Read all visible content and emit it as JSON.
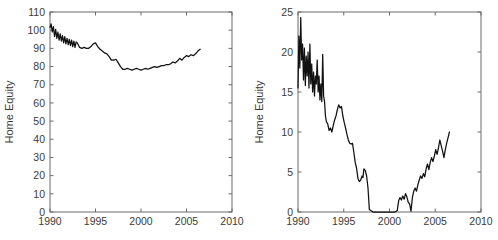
{
  "figure": {
    "background_color": "#ffffff",
    "axis_color": "#6b6b6b",
    "line_color": "#111111",
    "panel_count": 2
  },
  "chart_data": [
    {
      "type": "line",
      "panel": "left",
      "title": "",
      "xlabel": "",
      "ylabel": "Home Equity",
      "xlim": [
        1990,
        2010
      ],
      "ylim": [
        0,
        110
      ],
      "xticks": [
        1990,
        1995,
        2000,
        2005,
        2010
      ],
      "xticklabels": [
        "1990",
        "1995",
        "2000",
        "2005",
        "2010"
      ],
      "yticks": [
        0,
        10,
        20,
        30,
        40,
        50,
        60,
        70,
        80,
        90,
        100,
        110
      ],
      "yticklabels": [
        "0",
        "10",
        "20",
        "30",
        "40",
        "50",
        "60",
        "70",
        "80",
        "90",
        "100",
        "110"
      ],
      "grid": false,
      "legend": false,
      "series": [
        {
          "name": "Home Equity",
          "x": [
            1990.0,
            1990.12,
            1990.25,
            1990.37,
            1990.5,
            1990.62,
            1990.75,
            1990.87,
            1991.0,
            1991.12,
            1991.25,
            1991.37,
            1991.5,
            1991.62,
            1991.75,
            1991.87,
            1992.0,
            1992.12,
            1992.25,
            1992.37,
            1992.5,
            1992.62,
            1992.75,
            1992.87,
            1993.0,
            1993.25,
            1993.5,
            1993.75,
            1994.0,
            1994.25,
            1994.5,
            1994.75,
            1995.0,
            1995.25,
            1995.5,
            1995.75,
            1996.0,
            1996.25,
            1996.5,
            1996.75,
            1997.0,
            1997.25,
            1997.5,
            1997.75,
            1998.0,
            1998.25,
            1998.5,
            1998.75,
            1999.0,
            1999.25,
            1999.5,
            1999.75,
            2000.0,
            2000.25,
            2000.5,
            2000.75,
            2001.0,
            2001.25,
            2001.5,
            2001.75,
            2002.0,
            2002.25,
            2002.5,
            2002.75,
            2003.0,
            2003.25,
            2003.5,
            2003.75,
            2004.0,
            2004.25,
            2004.5,
            2004.75,
            2005.0,
            2005.25,
            2005.5,
            2005.75,
            2006.0,
            2006.25,
            2006.5
          ],
          "y": [
            101.5,
            103.5,
            99.0,
            102.0,
            96.5,
            100.5,
            95.5,
            99.0,
            94.5,
            98.0,
            94.0,
            97.0,
            93.0,
            96.5,
            92.5,
            95.5,
            92.0,
            95.0,
            91.5,
            94.5,
            91.0,
            94.0,
            90.5,
            93.5,
            93.0,
            90.5,
            90.0,
            90.5,
            90.0,
            90.0,
            91.0,
            92.5,
            93.0,
            91.0,
            89.5,
            88.5,
            87.5,
            87.0,
            85.5,
            83.5,
            83.5,
            84.0,
            82.0,
            80.0,
            78.5,
            78.5,
            79.0,
            78.5,
            78.0,
            78.5,
            79.0,
            78.5,
            78.0,
            78.5,
            79.0,
            78.5,
            79.0,
            79.5,
            80.0,
            79.5,
            80.0,
            80.5,
            80.5,
            81.0,
            81.0,
            81.5,
            82.5,
            82.0,
            83.0,
            84.5,
            83.5,
            85.0,
            86.0,
            85.5,
            86.5,
            86.0,
            87.0,
            88.5,
            89.5
          ]
        }
      ]
    },
    {
      "type": "line",
      "panel": "right",
      "title": "",
      "xlabel": "",
      "ylabel": "Home Equity",
      "xlim": [
        1990,
        2010
      ],
      "ylim": [
        0,
        25
      ],
      "xticks": [
        1990,
        1995,
        2000,
        2005,
        2010
      ],
      "xticklabels": [
        "1990",
        "1995",
        "2000",
        "2005",
        "2010"
      ],
      "yticks": [
        0,
        5,
        10,
        15,
        20,
        25
      ],
      "yticklabels": [
        "0",
        "5",
        "10",
        "15",
        "20",
        "25"
      ],
      "grid": false,
      "legend": false,
      "series": [
        {
          "name": "Home Equity",
          "x": [
            1990.0,
            1990.1,
            1990.2,
            1990.3,
            1990.4,
            1990.5,
            1990.6,
            1990.7,
            1990.8,
            1990.9,
            1991.0,
            1991.1,
            1991.2,
            1991.3,
            1991.4,
            1991.5,
            1991.6,
            1991.7,
            1991.8,
            1991.9,
            1992.0,
            1992.1,
            1992.2,
            1992.3,
            1992.4,
            1992.5,
            1992.6,
            1992.7,
            1992.8,
            1992.9,
            1993.0,
            1993.1,
            1993.25,
            1993.4,
            1993.55,
            1993.7,
            1993.85,
            1994.0,
            1994.15,
            1994.3,
            1994.45,
            1994.6,
            1994.75,
            1994.9,
            1995.05,
            1995.2,
            1995.35,
            1995.5,
            1995.65,
            1995.8,
            1995.95,
            1996.1,
            1996.25,
            1996.4,
            1996.55,
            1996.7,
            1996.85,
            1997.0,
            1997.1,
            1997.2,
            1997.35,
            1997.5,
            1997.65,
            1997.8,
            1998.2,
            1998.8,
            1999.4,
            2000.0,
            2000.6,
            2000.85,
            2001.0,
            2001.15,
            2001.3,
            2001.45,
            2001.6,
            2001.75,
            2001.9,
            2002.05,
            2002.2,
            2002.35,
            2002.5,
            2002.65,
            2002.8,
            2002.95,
            2003.1,
            2003.25,
            2003.4,
            2003.55,
            2003.7,
            2003.85,
            2004.0,
            2004.15,
            2004.3,
            2004.45,
            2004.6,
            2004.75,
            2004.9,
            2005.05,
            2005.2,
            2005.35,
            2005.5,
            2005.65,
            2005.8,
            2005.95,
            2006.1,
            2006.25,
            2006.4,
            2006.55
          ],
          "y": [
            15.5,
            22.0,
            18.0,
            24.3,
            19.0,
            21.0,
            16.5,
            20.5,
            15.8,
            19.5,
            17.0,
            20.0,
            15.5,
            21.0,
            16.0,
            18.5,
            15.0,
            17.5,
            14.5,
            17.0,
            16.0,
            19.0,
            15.0,
            17.0,
            14.0,
            16.0,
            13.8,
            19.7,
            14.5,
            13.8,
            12.0,
            11.3,
            11.0,
            10.2,
            10.5,
            10.0,
            10.8,
            11.5,
            12.0,
            12.8,
            13.4,
            13.0,
            13.2,
            12.0,
            11.2,
            10.5,
            9.7,
            9.0,
            8.6,
            8.5,
            8.6,
            7.5,
            6.2,
            5.5,
            4.2,
            3.8,
            4.0,
            4.5,
            4.3,
            5.4,
            5.2,
            4.5,
            3.0,
            0.3,
            0.0,
            0.0,
            0.0,
            0.0,
            0.0,
            0.2,
            1.4,
            1.8,
            1.5,
            2.0,
            1.6,
            2.3,
            1.9,
            1.2,
            1.0,
            0.1,
            1.8,
            2.6,
            3.0,
            2.6,
            3.4,
            4.0,
            4.5,
            4.2,
            4.8,
            4.4,
            5.4,
            6.0,
            5.3,
            6.2,
            6.8,
            6.3,
            7.0,
            7.8,
            7.2,
            8.0,
            9.0,
            8.3,
            7.6,
            6.8,
            7.8,
            8.6,
            9.3,
            10.0
          ]
        }
      ]
    }
  ]
}
